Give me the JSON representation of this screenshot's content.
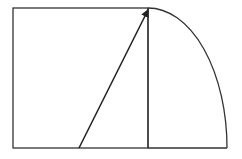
{
  "diagram": {
    "stroke_color": "#222222",
    "background": "#ffffff",
    "shapes": {
      "rectangle": {
        "x": 13,
        "y": 8,
        "width": 136,
        "height": 140
      },
      "vertical_line": {
        "x1": 148,
        "y1": 8,
        "x2": 148,
        "y2": 148
      },
      "bottom_extension": {
        "x1": 148,
        "y1": 148,
        "x2": 227,
        "y2": 148
      },
      "arc": {
        "start": [
          149,
          8
        ],
        "end": [
          227,
          148
        ],
        "rx": 79,
        "ry": 140
      },
      "arrow": {
        "x1": 79,
        "y1": 148,
        "x2": 149,
        "y2": 9
      }
    }
  }
}
